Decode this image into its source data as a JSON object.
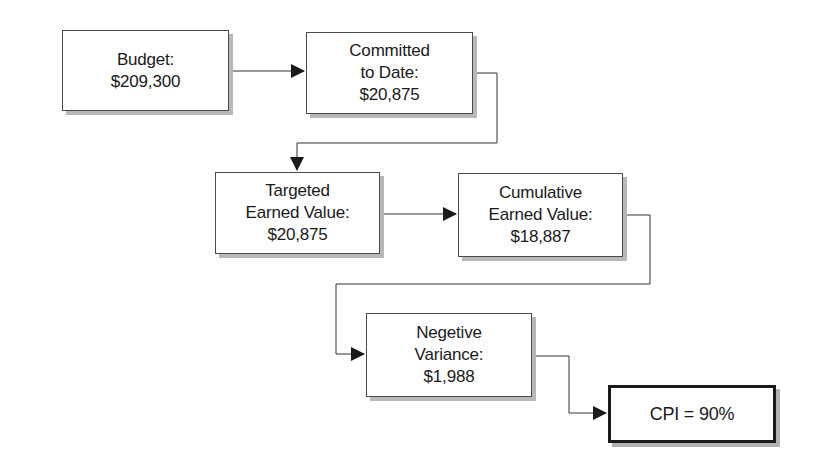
{
  "diagram": {
    "colors": {
      "line": "#333333",
      "box_border": "#4a4a4a",
      "shadow": "#b8b8b8",
      "background": "#ffffff"
    },
    "nodes": [
      {
        "id": "budget",
        "lines": [
          "Budget:",
          "$209,300"
        ]
      },
      {
        "id": "committed",
        "lines": [
          "Committed",
          "to Date:",
          "$20,875"
        ]
      },
      {
        "id": "targeted",
        "lines": [
          "Targeted",
          "Earned Value:",
          "$20,875"
        ]
      },
      {
        "id": "cumulative",
        "lines": [
          "Cumulative",
          "Earned Value:",
          "$18,887"
        ]
      },
      {
        "id": "negative",
        "lines": [
          "Negetive",
          "Variance:",
          "$1,988"
        ]
      },
      {
        "id": "cpi",
        "lines": [
          "CPI = 90%"
        ]
      }
    ],
    "edges": [
      {
        "from": "budget",
        "to": "committed"
      },
      {
        "from": "committed",
        "to": "targeted"
      },
      {
        "from": "targeted",
        "to": "cumulative"
      },
      {
        "from": "cumulative",
        "to": "negative"
      },
      {
        "from": "negative",
        "to": "cpi"
      }
    ]
  }
}
